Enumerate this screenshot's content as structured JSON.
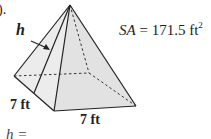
{
  "problem": {
    "number_fragment": ").",
    "surface_area_var": "SA",
    "surface_area_eq": " = 171.5 ft",
    "surface_area_exp": "2",
    "slant_label": "h",
    "base_side_1": "7 ft",
    "base_side_2": "7 ft",
    "answer_prompt": "h ="
  },
  "figure": {
    "shape": "square pyramid",
    "apex": [
      70,
      5
    ],
    "base_left": [
      14,
      76
    ],
    "base_front": [
      54,
      111
    ],
    "base_right": [
      136,
      106
    ],
    "base_back_hidden": [
      89,
      73
    ],
    "slant_height_foot": [
      34,
      93
    ]
  }
}
